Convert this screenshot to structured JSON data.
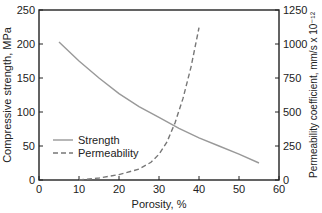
{
  "chart_data": {
    "type": "line",
    "title": "",
    "xlabel": "Porosity, %",
    "ylabel": "Compressive strength, MPa",
    "y2label": "Permeability coefficient, mm/s x 10⁻¹²",
    "xlim": [
      0,
      60
    ],
    "ylim": [
      0,
      250
    ],
    "y2lim": [
      0,
      1250
    ],
    "x_ticks": [
      "0",
      "10",
      "20",
      "30",
      "40",
      "50",
      "60"
    ],
    "y_ticks": [
      "0",
      "50",
      "100",
      "150",
      "200",
      "250"
    ],
    "y2_ticks": [
      "0",
      "250",
      "500",
      "750",
      "1000",
      "1250"
    ],
    "grid": false,
    "legend_position": "lower left",
    "series": [
      {
        "name": "Strength",
        "axis": "left",
        "style": "solid",
        "color": "#999999",
        "x": [
          5,
          10,
          15,
          20,
          25,
          30,
          35,
          40,
          45,
          50,
          55
        ],
        "values": [
          203,
          175,
          150,
          127,
          108,
          92,
          76,
          62,
          50,
          38,
          25
        ]
      },
      {
        "name": "Permeability",
        "axis": "right",
        "style": "dashed",
        "color": "#777777",
        "x": [
          10,
          15,
          20,
          25,
          28,
          30,
          32,
          34,
          36,
          38,
          40
        ],
        "values": [
          0,
          15,
          40,
          80,
          130,
          190,
          280,
          420,
          600,
          830,
          1120
        ]
      }
    ]
  }
}
